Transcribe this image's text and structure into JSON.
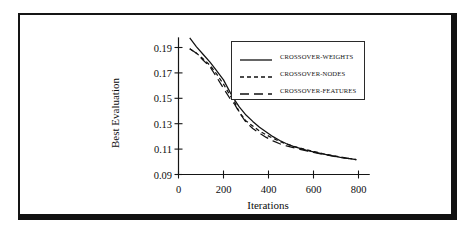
{
  "figure": {
    "frame_color": "#111111",
    "background": "#ffffff"
  },
  "chart_data": {
    "type": "line",
    "title": "",
    "subtitle": "",
    "xlabel": "Iterations",
    "ylabel": "Best Evaluation",
    "xlim": [
      0,
      850
    ],
    "ylim": [
      0.09,
      0.2
    ],
    "xticks": [
      0,
      200,
      400,
      600,
      800
    ],
    "xtick_labels": [
      "0",
      "200",
      "400",
      "600",
      "800"
    ],
    "yticks": [
      0.09,
      0.11,
      0.13,
      0.15,
      0.17,
      0.19
    ],
    "ytick_labels": [
      "0.09",
      "0.11",
      "0.13",
      "0.15",
      "0.17",
      "0.19"
    ],
    "grid": false,
    "legend_position": "upper-right-inside",
    "legend_border_color": "#2a2a2a",
    "line_color": "#111111",
    "series": [
      {
        "name": "CROSSOVER-WEIGHTS",
        "style": "solid",
        "dash": "none",
        "color": "#111111",
        "x": [
          50,
          80,
          110,
          140,
          170,
          200,
          230,
          250,
          270,
          300,
          330,
          360,
          390,
          420,
          450,
          480,
          510,
          540,
          570,
          600,
          640,
          680,
          720,
          760,
          790
        ],
        "y": [
          0.1975,
          0.1905,
          0.1845,
          0.1785,
          0.1715,
          0.1645,
          0.1545,
          0.1485,
          0.1432,
          0.1368,
          0.1318,
          0.1272,
          0.1235,
          0.1198,
          0.1168,
          0.1142,
          0.1122,
          0.1105,
          0.109,
          0.1078,
          0.1062,
          0.1048,
          0.1035,
          0.1025,
          0.1018
        ]
      },
      {
        "name": "CROSSOVER-NODES",
        "style": "dotted-dash",
        "dash": "4,3",
        "color": "#111111",
        "x": [
          50,
          80,
          110,
          140,
          170,
          200,
          230,
          250,
          270,
          300,
          330,
          360,
          390,
          420,
          450,
          480,
          510,
          540,
          570,
          600,
          640,
          680,
          720,
          760,
          790
        ],
        "y": [
          0.189,
          0.1855,
          0.181,
          0.176,
          0.169,
          0.1612,
          0.152,
          0.1468,
          0.1392,
          0.1322,
          0.1282,
          0.1242,
          0.1212,
          0.1185,
          0.116,
          0.114,
          0.1122,
          0.1108,
          0.1095,
          0.1082,
          0.1065,
          0.105,
          0.1038,
          0.1026,
          0.1018
        ]
      },
      {
        "name": "CROSSOVER-FEATURES",
        "style": "dashed",
        "dash": "9,5",
        "color": "#111111",
        "x": [
          50,
          80,
          110,
          140,
          170,
          200,
          230,
          250,
          270,
          300,
          330,
          360,
          390,
          420,
          450,
          480,
          510,
          540,
          570,
          600,
          640,
          680,
          720,
          760,
          790
        ],
        "y": [
          0.189,
          0.1855,
          0.18,
          0.1748,
          0.1665,
          0.1578,
          0.1495,
          0.1452,
          0.1388,
          0.1312,
          0.1262,
          0.1225,
          0.1192,
          0.1165,
          0.1142,
          0.1125,
          0.1112,
          0.1098,
          0.1086,
          0.1075,
          0.106,
          0.1046,
          0.1034,
          0.1024,
          0.1018
        ]
      }
    ]
  }
}
